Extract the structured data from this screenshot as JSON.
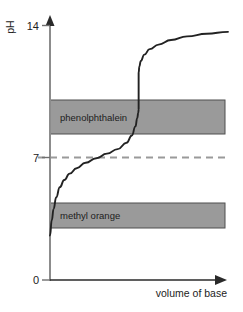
{
  "chart_data": {
    "type": "line",
    "title": "",
    "subtitle": "",
    "xlabel": "volume of base",
    "ylabel": "pH",
    "ylim": [
      0,
      14
    ],
    "y_ticks": [
      "0",
      "7",
      "14"
    ],
    "y_tick_values": [
      0,
      7,
      14
    ],
    "x_ticks": [],
    "grid": false,
    "legend_position": "none",
    "series": [
      {
        "name": "titration curve",
        "x": [
          0.0,
          1.0,
          2.0,
          3.5,
          5.5,
          8.0,
          11.0,
          15.0,
          20.0,
          26.0,
          32.0,
          38.0,
          43.0,
          46.0,
          48.0,
          49.0,
          49.6,
          49.8,
          49.8,
          50.2,
          51.0,
          53.0,
          56.0,
          61.0,
          68.0,
          77.0,
          88.0,
          100.0
        ],
        "y": [
          2.45,
          3.3,
          3.9,
          4.55,
          5.1,
          5.5,
          5.85,
          6.15,
          6.45,
          6.7,
          6.95,
          7.2,
          7.55,
          7.95,
          8.45,
          8.9,
          9.2,
          9.4,
          11.4,
          11.75,
          12.05,
          12.4,
          12.7,
          12.95,
          13.2,
          13.4,
          13.55,
          13.65
        ]
      }
    ],
    "indicator_bands": [
      {
        "name": "phenolphthalein",
        "label": "phenolphthalein",
        "ph_low": 8.3,
        "ph_high": 10.0,
        "color": "#9a9a9a"
      },
      {
        "name": "methyl orange",
        "label": "methyl orange",
        "ph_low": 3.1,
        "ph_high": 4.4,
        "color": "#9a9a9a"
      }
    ],
    "reference_lines": [
      {
        "name": "neutral-ph-line",
        "value": 7,
        "style": "dashed",
        "color": "#9a9a9a"
      }
    ],
    "colors": {
      "curve": "#222222",
      "axis": "#808080",
      "band_fill": "#9a9a9a",
      "band_stroke": "#555555",
      "dashed_line": "#9a9a9a",
      "text": "#1c1c1c",
      "background": "#ffffff"
    }
  },
  "axes": {
    "y_axis_label": "pH",
    "x_axis_label": "volume of base",
    "tick_top": "14",
    "tick_mid": "7",
    "tick_bottom": "0"
  },
  "bands": {
    "upper_label": "phenolphthalein",
    "lower_label": "methyl orange"
  }
}
